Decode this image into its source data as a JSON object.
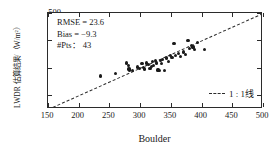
{
  "chart_data": {
    "type": "scatter",
    "title": "",
    "xlabel": "Boulder",
    "ylabel": "LWDR 估算结果/（W/m²）",
    "xlim": [
      150,
      500
    ],
    "ylim": [
      150,
      500
    ],
    "xticks": [
      150,
      200,
      250,
      300,
      350,
      400,
      450,
      500
    ],
    "yticks": [
      200,
      300,
      400,
      500
    ],
    "grid": false,
    "legend_position": "bottom-right",
    "legend": [
      {
        "label": "1 : 1线",
        "style": "dashed-line",
        "color": "#2b2b2b"
      }
    ],
    "reference_line": {
      "label": "1 : 1线",
      "type": "identity",
      "from": [
        150,
        150
      ],
      "to": [
        500,
        500
      ],
      "style": "dashed"
    },
    "annotations": [
      "RMSE = 23.6",
      "Bias = −9.3",
      "#Pts： 43"
    ],
    "marker": {
      "shape": "circle",
      "color": "#1a1a1a",
      "size": 3.2
    },
    "series": [
      {
        "name": "LWDR estimate vs Boulder",
        "x": [
          235,
          260,
          278,
          281,
          282,
          283,
          287,
          296,
          299,
          303,
          305,
          307,
          311,
          314,
          316,
          318,
          320,
          322,
          325,
          327,
          329,
          331,
          333,
          335,
          337,
          340,
          343,
          346,
          349,
          352,
          355,
          358,
          362,
          366,
          370,
          374,
          378,
          381,
          384,
          386,
          389,
          393,
          405
        ],
        "y": [
          270,
          278,
          318,
          308,
          296,
          292,
          290,
          303,
          299,
          315,
          300,
          296,
          318,
          312,
          299,
          306,
          322,
          310,
          328,
          318,
          292,
          290,
          326,
          316,
          330,
          290,
          336,
          324,
          345,
          339,
          389,
          344,
          352,
          342,
          358,
          350,
          401,
          372,
          381,
          376,
          367,
          392,
          368
        ]
      }
    ]
  },
  "axis": {
    "x_title": "Boulder",
    "y_title": "LWDR 估算结果/（W/m²）",
    "x_tick_labels": [
      "150",
      "200",
      "250",
      "300",
      "350",
      "400",
      "450",
      "500"
    ],
    "y_tick_labels": [
      "500",
      "400",
      "300",
      "200"
    ]
  },
  "stats": {
    "rmse": "RMSE = 23.6",
    "bias": "Bias = −9.3",
    "npts": "#Pts： 43"
  },
  "legend": {
    "one_to_one": "1 : 1线"
  },
  "colors": {
    "axis": "#2b2b2b",
    "marker": "#1a1a1a",
    "text": "#1a1a1a",
    "background": "#ffffff"
  }
}
